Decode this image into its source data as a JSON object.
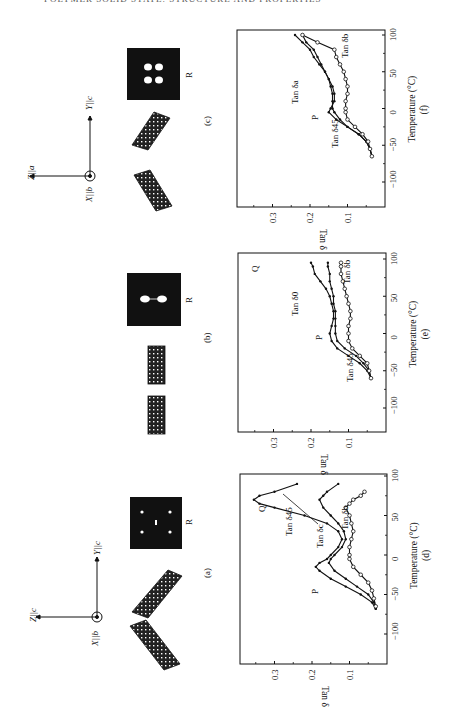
{
  "page": {
    "running_header": "POLYMER SOLID STATE: STRUCTURE AND PROPERTIES"
  },
  "figure": {
    "orientation": "rotated 90° counter-clockwise (landscape figure on portrait page)",
    "structure_panels": [
      {
        "id": "a",
        "label": "(a)",
        "axes": {
          "z": "Z||c",
          "y": "Y||c",
          "x": "X||b"
        },
        "pattern_label": "R",
        "pattern": "four-point"
      },
      {
        "id": "b",
        "label": "(b)",
        "axes": null,
        "pattern_label": "R",
        "pattern": "two-point"
      },
      {
        "id": "c",
        "label": "(c)",
        "axes": {
          "z": "Z||a",
          "y": "Y||c",
          "x": "X||b"
        },
        "pattern_label": "R",
        "pattern": "four-lobe"
      }
    ]
  },
  "chart_data": [
    {
      "id": "d",
      "panel_label": "(d)",
      "type": "line",
      "xlabel": "Temperature (°C)",
      "ylabel": "Tan δ",
      "xlim": [
        -140,
        100
      ],
      "ylim": [
        0,
        0.38
      ],
      "xticks": [
        "−100",
        "−50",
        "0",
        "50",
        "100"
      ],
      "yticks": [
        "0.1",
        "0.2",
        "0.3"
      ],
      "annotations": [
        "P",
        "Q",
        "Tan δ45",
        "Tan δc",
        "Tan δb"
      ],
      "series": [
        {
          "name": "Tan δ45",
          "marker": "dot",
          "x": [
            -68,
            -60,
            -50,
            -40,
            -30,
            -20,
            -15,
            -10,
            -5,
            0,
            10,
            20,
            30,
            40,
            50,
            60,
            65,
            70,
            75,
            80,
            90
          ],
          "y": [
            0.03,
            0.04,
            0.07,
            0.11,
            0.15,
            0.18,
            0.19,
            0.18,
            0.16,
            0.15,
            0.13,
            0.12,
            0.13,
            0.16,
            0.22,
            0.3,
            0.34,
            0.355,
            0.34,
            0.3,
            0.24
          ]
        },
        {
          "name": "Tan δc",
          "marker": "dot",
          "x": [
            -68,
            -60,
            -50,
            -40,
            -30,
            -20,
            -10,
            -5,
            0,
            10,
            20,
            30,
            40,
            50,
            60,
            70,
            75,
            80,
            90
          ],
          "y": [
            0.03,
            0.035,
            0.05,
            0.08,
            0.11,
            0.14,
            0.155,
            0.15,
            0.14,
            0.12,
            0.11,
            0.115,
            0.13,
            0.15,
            0.17,
            0.18,
            0.17,
            0.16,
            0.13
          ]
        },
        {
          "name": "Tan δb",
          "marker": "circle",
          "x": [
            -65,
            -55,
            -45,
            -35,
            -25,
            -15,
            -5,
            0,
            10,
            20,
            30,
            40,
            50,
            60,
            65,
            70,
            75,
            80
          ],
          "y": [
            0.03,
            0.035,
            0.04,
            0.05,
            0.07,
            0.09,
            0.1,
            0.1,
            0.1,
            0.095,
            0.09,
            0.095,
            0.1,
            0.11,
            0.1,
            0.09,
            0.07,
            0.06
          ]
        }
      ]
    },
    {
      "id": "e",
      "panel_label": "(e)",
      "type": "line",
      "xlabel": "Temperature (°C)",
      "ylabel": "Tan δ",
      "xlim": [
        -140,
        100
      ],
      "ylim": [
        0,
        0.38
      ],
      "xticks": [
        "−100",
        "−50",
        "0",
        "50",
        "100"
      ],
      "yticks": [
        "0.1",
        "0.2",
        "0.3"
      ],
      "annotations": [
        "P",
        "Q",
        "Tan δ45",
        "Tan δ0",
        "Tan δb"
      ],
      "series": [
        {
          "name": "Tan δ0",
          "marker": "dot",
          "x": [
            -60,
            -50,
            -40,
            -30,
            -20,
            -10,
            0,
            10,
            20,
            30,
            40,
            50,
            60,
            70,
            80,
            90,
            95
          ],
          "y": [
            0.04,
            0.05,
            0.07,
            0.1,
            0.13,
            0.145,
            0.15,
            0.145,
            0.14,
            0.14,
            0.145,
            0.15,
            0.16,
            0.175,
            0.19,
            0.195,
            0.2
          ]
        },
        {
          "name": "Tan δ45",
          "marker": "dot",
          "x": [
            -60,
            -50,
            -40,
            -30,
            -20,
            -10,
            0,
            10,
            20,
            30,
            40,
            50,
            60,
            70,
            80,
            90,
            95
          ],
          "y": [
            0.04,
            0.045,
            0.06,
            0.08,
            0.11,
            0.13,
            0.135,
            0.135,
            0.135,
            0.135,
            0.14,
            0.14,
            0.145,
            0.15,
            0.15,
            0.155,
            0.155
          ]
        },
        {
          "name": "Tan δb",
          "marker": "circle",
          "x": [
            -60,
            -50,
            -40,
            -30,
            -20,
            -10,
            0,
            10,
            20,
            30,
            40,
            50,
            60,
            70,
            80,
            90,
            95
          ],
          "y": [
            0.04,
            0.045,
            0.05,
            0.07,
            0.09,
            0.1,
            0.1,
            0.1,
            0.095,
            0.095,
            0.1,
            0.105,
            0.11,
            0.115,
            0.12,
            0.12,
            0.12
          ]
        }
      ]
    },
    {
      "id": "f",
      "panel_label": "(f)",
      "type": "line",
      "xlabel": "Temperature (°C)",
      "ylabel": "Tan δ",
      "xlim": [
        -140,
        100
      ],
      "ylim": [
        0,
        0.38
      ],
      "xticks": [
        "−100",
        "−50",
        "0",
        "50",
        "100"
      ],
      "yticks": [
        "0.1",
        "0.2",
        "0.3"
      ],
      "annotations": [
        "P",
        "Tan δ45",
        "Tan δa",
        "Tan δb"
      ],
      "series": [
        {
          "name": "Tan δa",
          "marker": "dot",
          "x": [
            -65,
            -55,
            -45,
            -35,
            -25,
            -15,
            -5,
            0,
            10,
            20,
            30,
            40,
            50,
            60,
            70,
            80,
            90,
            100
          ],
          "y": [
            0.035,
            0.04,
            0.05,
            0.07,
            0.1,
            0.13,
            0.15,
            0.145,
            0.135,
            0.135,
            0.14,
            0.15,
            0.16,
            0.175,
            0.19,
            0.2,
            0.22,
            0.24
          ]
        },
        {
          "name": "Tan δ45",
          "marker": "dot",
          "x": [
            -65,
            -55,
            -45,
            -35,
            -25,
            -15,
            -5,
            0,
            10,
            20,
            30,
            40,
            50,
            60,
            70,
            80,
            90,
            100
          ],
          "y": [
            0.035,
            0.04,
            0.05,
            0.07,
            0.1,
            0.12,
            0.135,
            0.14,
            0.14,
            0.14,
            0.145,
            0.15,
            0.16,
            0.17,
            0.18,
            0.19,
            0.21,
            0.22
          ]
        },
        {
          "name": "Tan δb",
          "marker": "circle",
          "x": [
            -65,
            -55,
            -45,
            -35,
            -25,
            -15,
            -5,
            0,
            10,
            20,
            30,
            40,
            50,
            60,
            70,
            80,
            90,
            100
          ],
          "y": [
            0.035,
            0.04,
            0.045,
            0.06,
            0.08,
            0.1,
            0.105,
            0.105,
            0.105,
            0.1,
            0.1,
            0.105,
            0.11,
            0.12,
            0.13,
            0.135,
            0.18,
            0.22
          ]
        }
      ]
    }
  ]
}
